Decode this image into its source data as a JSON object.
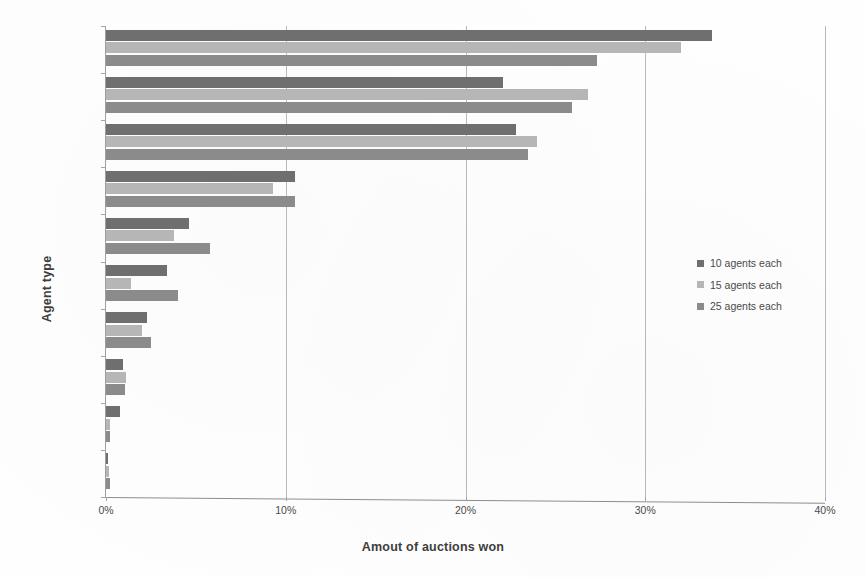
{
  "chart_data": {
    "type": "bar",
    "orientation": "horizontal",
    "title": "",
    "xlabel": "Amout of auctions won",
    "ylabel": "Agent type",
    "categories": [
      "CBS",
      "CTS",
      "EPS",
      "CBBMS",
      "EPBMS",
      "CTBMS",
      "RS",
      "CBPBMS",
      "RBMS",
      "PBMS"
    ],
    "series": [
      {
        "name": "10 agents each",
        "color": "#6f6f6f",
        "values": [
          33.7,
          22.1,
          22.8,
          10.5,
          4.6,
          3.4,
          2.3,
          0.95,
          0.8,
          0.1
        ]
      },
      {
        "name": "15 agents each",
        "color": "#b6b6b6",
        "values": [
          32.0,
          26.8,
          24.0,
          9.3,
          3.8,
          1.4,
          2.0,
          1.1,
          0.2,
          0.15
        ]
      },
      {
        "name": "25 agents each",
        "color": "#8b8b8b",
        "values": [
          27.3,
          25.9,
          23.5,
          10.5,
          5.8,
          4.0,
          2.5,
          1.05,
          0.2,
          0.2
        ]
      }
    ],
    "xlim": [
      0,
      40
    ],
    "xticks": [
      0,
      10,
      20,
      30,
      40
    ],
    "xticklabels": [
      "0%",
      "10%",
      "20%",
      "30%",
      "40%"
    ],
    "grid": "vertical-only",
    "legend_position": "right"
  },
  "legend": {
    "entries": [
      {
        "label": "10 agents each",
        "color": "#6f6f6f"
      },
      {
        "label": "15 agents each",
        "color": "#b6b6b6"
      },
      {
        "label": "25 agents each",
        "color": "#8b8b8b"
      }
    ]
  }
}
